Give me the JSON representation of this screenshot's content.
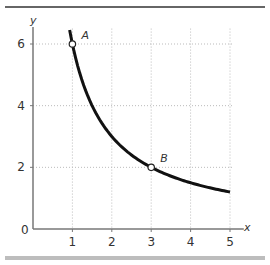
{
  "chart_data": {
    "type": "line",
    "title": "",
    "xlabel": "x",
    "ylabel": "y",
    "xlim": [
      0,
      5
    ],
    "ylim": [
      0,
      6.5
    ],
    "x_ticks": [
      "1",
      "2",
      "3",
      "4",
      "5"
    ],
    "y_ticks": [
      "0",
      "2",
      "4",
      "6"
    ],
    "grid": true,
    "series": [
      {
        "name": "y = 6/x",
        "x": [
          0.93,
          1,
          1.5,
          2,
          2.5,
          3,
          3.5,
          4,
          4.5,
          5
        ],
        "values": [
          6.45,
          6,
          4,
          3,
          2.4,
          2,
          1.714,
          1.5,
          1.333,
          1.2
        ]
      }
    ],
    "points": [
      {
        "label": "A",
        "x": 1,
        "y": 6
      },
      {
        "label": "B",
        "x": 3,
        "y": 2
      }
    ],
    "axis_labels": {
      "x": "x",
      "y": "y"
    },
    "origin_label": "0"
  },
  "colors": {
    "curve": "#111111",
    "grid": "#bbbbbb",
    "axis": "#777777",
    "top_rule": "#666666",
    "bottom_bar": "#bdbdbd"
  }
}
